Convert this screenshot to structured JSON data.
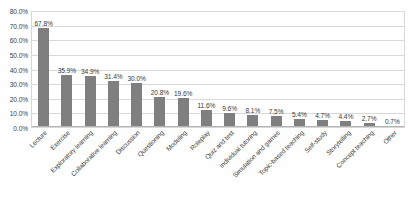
{
  "chart_data": {
    "type": "bar",
    "title": "",
    "subtitle": "",
    "xlabel": "",
    "ylabel": "",
    "ylim": [
      0,
      80
    ],
    "grid": true,
    "legend": false,
    "orientation": "vertical",
    "value_format": "percent",
    "bar_color": "#7f7f7f",
    "gridline_color": "#d9d9d9",
    "categories": [
      "Lecture",
      "Exercise",
      "Exploratory learning",
      "Collaborative learning",
      "Discussion",
      "Questioning",
      "Modeling",
      "Roleplay",
      "Quiz and test",
      "Individual tutoring",
      "Simulation and games",
      "Topic-based teaching",
      "Self-study",
      "Storytelling",
      "Concept teaching",
      "Other"
    ],
    "values": [
      67.8,
      35.9,
      34.9,
      31.4,
      30.0,
      20.8,
      19.6,
      11.6,
      9.6,
      8.1,
      7.5,
      5.4,
      4.7,
      4.4,
      2.7,
      0.7
    ],
    "data_labels": [
      "67.8%",
      "35.9%",
      "34.9%",
      "31.4%",
      "30.0%",
      "20.8%",
      "19.6%",
      "11.6%",
      "9.6%",
      "8.1%",
      "7.5%",
      "5.4%",
      "4.7%",
      "4.4%",
      "2.7%",
      "0.7%"
    ],
    "yticks": [
      0,
      10,
      20,
      30,
      40,
      50,
      60,
      70,
      80
    ],
    "ytick_labels": [
      "0.0%",
      "10.0%",
      "20.0%",
      "30.0%",
      "40.0%",
      "50.0%",
      "60.0%",
      "70.0%",
      "80.0%"
    ]
  }
}
